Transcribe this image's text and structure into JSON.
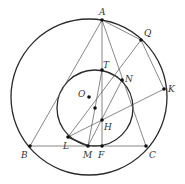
{
  "diagram": {
    "type": "geometry",
    "circles": [
      {
        "name": "outer-circle",
        "cx": 89,
        "cy": 97,
        "r": 78,
        "stroke_width": 1.3
      },
      {
        "name": "inner-circle",
        "cx": 95,
        "cy": 108,
        "r": 38,
        "stroke_width": 1.3
      }
    ],
    "points": [
      {
        "id": "A",
        "x": 102,
        "y": 20,
        "lx": 99,
        "ly": 15,
        "dot": true
      },
      {
        "id": "Q",
        "x": 141,
        "y": 40,
        "lx": 144,
        "ly": 36,
        "dot": true
      },
      {
        "id": "K",
        "x": 164,
        "y": 89,
        "lx": 168,
        "ly": 92,
        "dot": true
      },
      {
        "id": "T",
        "x": 102,
        "y": 70,
        "lx": 103,
        "ly": 68,
        "dot": true
      },
      {
        "id": "N",
        "x": 122,
        "y": 80,
        "lx": 125,
        "ly": 82,
        "dot": true
      },
      {
        "id": "O",
        "x": 89,
        "y": 97,
        "lx": 78,
        "ly": 97,
        "dot": true
      },
      {
        "id": "",
        "x": 95,
        "y": 108,
        "lx": 0,
        "ly": 0,
        "dot": true
      },
      {
        "id": "H",
        "x": 102,
        "y": 120,
        "lx": 104,
        "ly": 130,
        "dot": true
      },
      {
        "id": "L",
        "x": 68,
        "y": 137,
        "lx": 63,
        "ly": 149,
        "dot": true
      },
      {
        "id": "M",
        "x": 88,
        "y": 146,
        "lx": 83,
        "ly": 158,
        "dot": true
      },
      {
        "id": "F",
        "x": 102,
        "y": 146,
        "lx": 98,
        "ly": 158,
        "dot": true
      },
      {
        "id": "B",
        "x": 30,
        "y": 146,
        "lx": 21,
        "ly": 158,
        "dot": true
      },
      {
        "id": "C",
        "x": 146,
        "y": 146,
        "lx": 149,
        "ly": 158,
        "dot": true
      }
    ],
    "segments": [
      [
        "A",
        "B"
      ],
      [
        "A",
        "C"
      ],
      [
        "A",
        "F"
      ],
      [
        "A",
        "Q"
      ],
      [
        "Q",
        "K"
      ],
      [
        "B",
        "C"
      ],
      [
        "Q",
        "L"
      ],
      [
        "K",
        "L"
      ],
      [
        "T",
        "M"
      ],
      [
        "N",
        "M"
      ]
    ],
    "thick_segments": [
      [
        "L",
        "M"
      ]
    ]
  }
}
